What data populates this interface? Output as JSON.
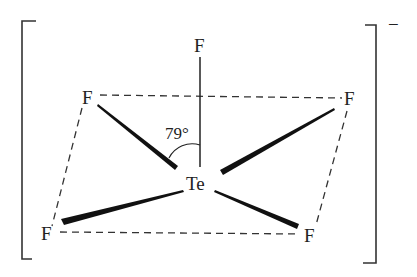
{
  "diagram": {
    "central_atom": {
      "label": "Te",
      "x": 198,
      "y": 190
    },
    "atoms": [
      {
        "id": "F_top",
        "label": "F",
        "x": 200,
        "y": 52
      },
      {
        "id": "F_upper_left",
        "label": "F",
        "x": 88,
        "y": 104
      },
      {
        "id": "F_upper_right",
        "label": "F",
        "x": 350,
        "y": 105
      },
      {
        "id": "F_lower_left",
        "label": "F",
        "x": 47,
        "y": 239
      },
      {
        "id": "F_lower_right",
        "label": "F",
        "x": 310,
        "y": 241
      }
    ],
    "angle_label": "79°",
    "charge": "−",
    "colors": {
      "ink": "#222222",
      "background": "#ffffff"
    }
  }
}
